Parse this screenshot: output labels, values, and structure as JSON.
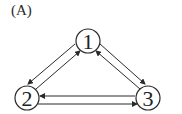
{
  "panel_label": "(A)",
  "nodes": [
    {
      "id": "1",
      "label": "1",
      "cx": 88,
      "cy": 41
    },
    {
      "id": "2",
      "label": "2",
      "cx": 27,
      "cy": 98
    },
    {
      "id": "3",
      "label": "3",
      "cx": 148,
      "cy": 98
    }
  ],
  "edges": [
    {
      "from": "1",
      "to": "2"
    },
    {
      "from": "2",
      "to": "1"
    },
    {
      "from": "1",
      "to": "3"
    },
    {
      "from": "3",
      "to": "1"
    },
    {
      "from": "3",
      "to": "2"
    },
    {
      "from": "2",
      "to": "3"
    }
  ],
  "colors": {
    "stroke": "#2a2a2a",
    "background": "#ffffff"
  }
}
